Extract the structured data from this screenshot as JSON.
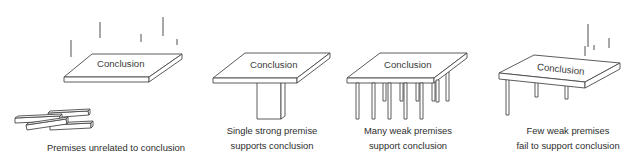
{
  "diagram": {
    "type": "argument-structure-metaphor",
    "panels": [
      {
        "id": "unrelated",
        "slab_label": "Conclusion",
        "caption_lines": [
          "Premises unrelated to conclusion"
        ],
        "support": "none (premises lie as scattered planks on the ground; falling lines above slab)",
        "premise_count": 4
      },
      {
        "id": "single-strong",
        "slab_label": "Conclusion",
        "caption_lines": [
          "Single strong premise",
          "supports conclusion"
        ],
        "support": "one thick pillar",
        "premise_count": 1
      },
      {
        "id": "many-weak",
        "slab_label": "Conclusion",
        "caption_lines": [
          "Many weak premises",
          "support conclusion"
        ],
        "support": "many thin legs",
        "premise_count": 11
      },
      {
        "id": "few-weak",
        "slab_label": "Conclusion",
        "caption_lines": [
          "Few weak premises",
          "fail to support conclusion"
        ],
        "support": "three thin legs, slab tilting; falling lines above",
        "premise_count": 3
      }
    ]
  },
  "colors": {
    "line": "#4a4a4a",
    "text": "#2e2e2e",
    "background": "#ffffff"
  }
}
